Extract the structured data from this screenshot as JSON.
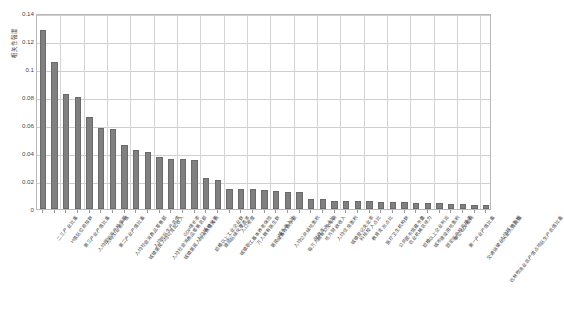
{
  "chart_data": {
    "type": "bar",
    "title": "",
    "xlabel": "",
    "ylabel": "相关性强度",
    "ylim": [
      0,
      0.14
    ],
    "yticks": [
      "0",
      "0.02",
      "0.04",
      "0.06",
      "0.08",
      "0.1",
      "0.12",
      "0.14"
    ],
    "ytick_values": [
      0,
      0.02,
      0.04,
      0.06,
      0.08,
      0.1,
      0.12,
      0.14
    ],
    "grid": true,
    "legend": "none",
    "bar_color": "#808080",
    "bar_edge_color": "#6a6a6a",
    "categories": [
      "二三产业比重",
      "H值区位商指数",
      "第三产业产值比重",
      "人均固定资产投资额",
      "人均工业总产值",
      "第二产业产值比重",
      "人均社会消费品零售额",
      "城镇居民人均可支配收入",
      "人均地区生产总值",
      "人均社会消费品零售总额",
      "城镇居民人均消费性支出",
      "GDP增长率",
      "人口城镇化率",
      "规模以上工业企业数",
      "建成区绿化覆盖率",
      "城镇职工基本养老保险",
      "人口密度",
      "万人拥有医生数",
      "居民储蓄存款余额",
      "城乡收入比",
      "人均公共绿地面积",
      "每万人拥有公交车辆",
      "财政支出占比",
      "地方财政收入",
      "人均住房面积",
      "城镇登记失业率",
      "科技投入占比",
      "教育支出占比",
      "医疗卫生机构数",
      "公共图书馆藏书量",
      "农业机械总动力",
      "规模以上企业利润",
      "城市建设用地面积",
      "固定资产投资增速",
      "单位GDP能耗",
      "第一产业产值比重",
      "交通运输业从业人员比重",
      "农林牧渔业总产值占地区生产总值比重",
      "人均耕地面积"
    ],
    "values": [
      0.128,
      0.105,
      0.082,
      0.08,
      0.066,
      0.058,
      0.057,
      0.046,
      0.042,
      0.041,
      0.037,
      0.036,
      0.036,
      0.035,
      0.022,
      0.021,
      0.0145,
      0.0142,
      0.014,
      0.0135,
      0.013,
      0.012,
      0.0118,
      0.0075,
      0.0072,
      0.0058,
      0.0056,
      0.0055,
      0.0054,
      0.0052,
      0.005,
      0.0048,
      0.0046,
      0.0044,
      0.0042,
      0.0038,
      0.0034,
      0.003,
      0.0026
    ]
  }
}
